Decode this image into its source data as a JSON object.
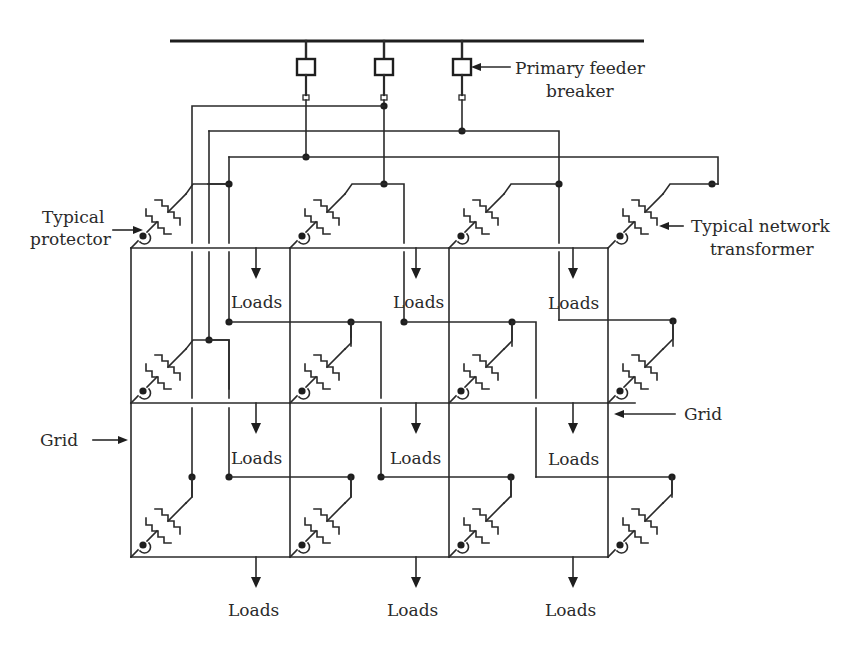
{
  "diagram": {
    "type": "secondary network distribution system",
    "labels": {
      "primary_feeder_breaker_line1": "Primary feeder",
      "primary_feeder_breaker_line2": "breaker",
      "typical_protector_line1": "Typical",
      "typical_protector_line2": "protector",
      "typical_network_transformer_line1": "Typical network",
      "typical_network_transformer_line2": "transformer",
      "grid_left": "Grid",
      "grid_right": "Grid",
      "loads": "Loads"
    },
    "primary_feeders": 3,
    "grid": {
      "columns_x": [
        131,
        290,
        449,
        608
      ],
      "rows_y": [
        248,
        403,
        557
      ]
    },
    "load_points": [
      {
        "id": "row1-col1",
        "label": "Loads"
      },
      {
        "id": "row1-col2",
        "label": "Loads"
      },
      {
        "id": "row1-col3",
        "label": "Loads"
      },
      {
        "id": "row2-col1",
        "label": "Loads"
      },
      {
        "id": "row2-col2",
        "label": "Loads"
      },
      {
        "id": "row2-col3",
        "label": "Loads"
      },
      {
        "id": "row3-col1",
        "label": "Loads"
      },
      {
        "id": "row3-col2",
        "label": "Loads"
      },
      {
        "id": "row3-col3",
        "label": "Loads"
      }
    ],
    "network_transformers": 12,
    "colors": {
      "line": "#2a2a2a",
      "background": "#ffffff"
    }
  }
}
